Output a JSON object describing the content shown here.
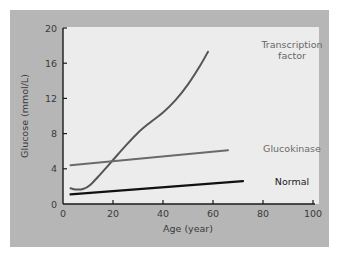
{
  "chart_data": {
    "type": "line",
    "title": "",
    "xlabel": "Age (year)",
    "ylabel": "Glucose (mmol/L)",
    "xlim": [
      0,
      100
    ],
    "ylim": [
      0,
      20
    ],
    "xticks": [
      0,
      20,
      40,
      60,
      80,
      100
    ],
    "yticks": [
      0,
      4,
      8,
      12,
      16,
      20
    ],
    "grid": false,
    "legend": "inline labels",
    "series": [
      {
        "name": "Transcription factor",
        "label_lines": [
          "Transcription",
          "factor"
        ],
        "color": "#555555",
        "x": [
          3,
          5,
          8,
          11,
          15,
          20,
          25,
          30,
          35,
          40,
          45,
          50,
          55,
          58
        ],
        "y": [
          1.8,
          1.65,
          1.7,
          2.2,
          3.4,
          5.0,
          6.6,
          8.1,
          9.3,
          10.4,
          11.8,
          13.6,
          15.8,
          17.3
        ]
      },
      {
        "name": "Glucokinase",
        "label_lines": [
          "Glucokinase"
        ],
        "color": "#6a6a6a",
        "x": [
          3,
          66
        ],
        "y": [
          4.4,
          6.1
        ]
      },
      {
        "name": "Normal",
        "label_lines": [
          "Normal"
        ],
        "color": "#111111",
        "x": [
          3,
          72
        ],
        "y": [
          1.1,
          2.6
        ]
      }
    ]
  },
  "colors": {
    "frame_bg": "#b4b4b4",
    "plot_bg": "#ebebeb",
    "axis": "#1a1a1a"
  }
}
